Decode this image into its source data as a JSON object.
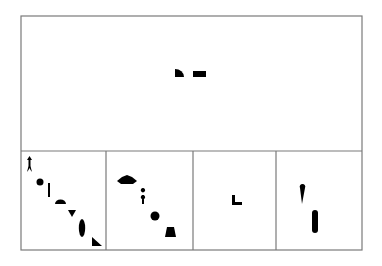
{
  "colors": {
    "background": "#ffffff",
    "line": "#7a7a7a",
    "ink": "#000000"
  },
  "frame": {
    "left": 21,
    "top": 16,
    "right": 362,
    "bottom": 250,
    "divider_y": 151,
    "vertical_dividers_x": [
      106,
      193,
      276
    ]
  },
  "panels": [
    {
      "id": "top-panel",
      "shapes": [
        {
          "name": "quarter-circle-shape",
          "kind": "path",
          "d": "M175 77 L175 69 A9 8 0 0 1 184 77 Z"
        },
        {
          "name": "rectangle-shape",
          "kind": "rect",
          "x": 193,
          "y": 71,
          "w": 13,
          "h": 6
        }
      ]
    },
    {
      "id": "option-panel-1",
      "shapes": [
        {
          "name": "arrow-shape",
          "kind": "path",
          "d": "M29.5 156 L32 160 L30.5 160 L30.5 166 L32 172 L30.5 170 L29.5 168 L28.5 170 L27 172 L28.5 166 L28.5 160 L27 160 Z"
        },
        {
          "name": "dot-shape",
          "kind": "circle",
          "cx": 40,
          "cy": 182,
          "r": 3.5
        },
        {
          "name": "vertical-bar-shape",
          "kind": "rect",
          "x": 48,
          "y": 183,
          "w": 2,
          "h": 14
        },
        {
          "name": "semicircle-shape",
          "kind": "path",
          "d": "M55 204 A5.5 4.5 0 0 1 66 204 Z"
        },
        {
          "name": "down-triangle-shape",
          "kind": "path",
          "d": "M68 210 L76 210 L72 217 Z"
        },
        {
          "name": "ellipse-shape",
          "kind": "ellipse",
          "cx": 82,
          "cy": 228,
          "rx": 3.2,
          "ry": 9
        },
        {
          "name": "right-triangle-shape",
          "kind": "path",
          "d": "M92 237 L102 246 L92 246 Z"
        }
      ]
    },
    {
      "id": "option-panel-2",
      "shapes": [
        {
          "name": "house-pentagon-shape",
          "kind": "path",
          "d": "M117 181 L122 177 L127 175 L132 177 L137 181 L133 184 L121 184 Z"
        },
        {
          "name": "pawn-shape",
          "kind": "path",
          "d": "M143 188 A2.2 2.2 0 1 1 142.9 188 M143 195 A2.2 2.2 0 1 1 142.9 195 M142 195 L144 195 L144 204 L142 204 Z"
        },
        {
          "name": "circle-shape",
          "kind": "circle",
          "cx": 155,
          "cy": 216,
          "r": 4.5
        },
        {
          "name": "trapezoid-shape",
          "kind": "path",
          "d": "M167 227 L174 227 L176 237 L165 237 Z"
        }
      ]
    },
    {
      "id": "option-panel-3",
      "shapes": [
        {
          "name": "l-shape",
          "kind": "path",
          "d": "M232 195 L235 195 L235 202 L242 202 L242 205 L232 205 Z"
        }
      ]
    },
    {
      "id": "option-panel-4",
      "shapes": [
        {
          "name": "teardrop-shape",
          "kind": "path",
          "d": "M302 204 L300 188 A2.8 2.8 0 1 1 305 188 Z"
        },
        {
          "name": "pill-shape",
          "kind": "rect",
          "x": 312,
          "y": 210,
          "w": 6,
          "h": 23,
          "rx": 3
        }
      ]
    }
  ]
}
